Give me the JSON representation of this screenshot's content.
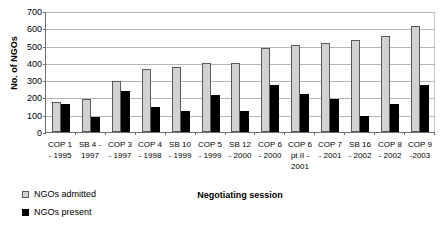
{
  "chart_data": {
    "type": "bar",
    "title": "",
    "xlabel": "Negotiating session",
    "ylabel": "No. of NGOs",
    "ylim": [
      0,
      700
    ],
    "yticks": [
      0,
      100,
      200,
      300,
      400,
      500,
      600,
      700
    ],
    "grid": true,
    "legend_position": "bottom-left",
    "categories": [
      "COP 1 - 1995",
      "SB 4 - 1997",
      "COP 3 - 1997",
      "COP 4 - 1998",
      "SB 10 - 1999",
      "COP 5 - 1999",
      "SB 12 - 2000",
      "COP 6 - 2000",
      "COP 6 pt II - 2001",
      "COP 7 - 2001",
      "SB 16 - 2002",
      "COP 8 - 2002",
      "COP 9 -2003"
    ],
    "category_lines": [
      [
        "COP 1",
        "- 1995"
      ],
      [
        "SB 4 -",
        "1997"
      ],
      [
        "COP 3",
        "- 1997"
      ],
      [
        "COP 4",
        "- 1998"
      ],
      [
        "SB 10",
        "- 1999"
      ],
      [
        "COP 5",
        "- 1999"
      ],
      [
        "SB 12",
        "- 2000"
      ],
      [
        "COP 6",
        "- 2000"
      ],
      [
        "COP 6",
        "pt II -",
        "2001"
      ],
      [
        "COP 7",
        "- 2001"
      ],
      [
        "SB 16",
        "- 2002"
      ],
      [
        "COP 8",
        "- 2002"
      ],
      [
        "COP 9",
        "-2003"
      ]
    ],
    "series": [
      {
        "name": "NGOs admitted",
        "color": "#d2d2d2",
        "values": [
          178,
          192,
          300,
          366,
          377,
          400,
          403,
          488,
          510,
          522,
          537,
          560,
          620
        ]
      },
      {
        "name": "NGOs present",
        "color": "#000000",
        "values": [
          163,
          85,
          237,
          148,
          123,
          215,
          120,
          273,
          220,
          195,
          95,
          163,
          272
        ]
      }
    ]
  },
  "legend": {
    "items": [
      {
        "label": "NGOs admitted"
      },
      {
        "label": "NGOs present"
      }
    ]
  }
}
